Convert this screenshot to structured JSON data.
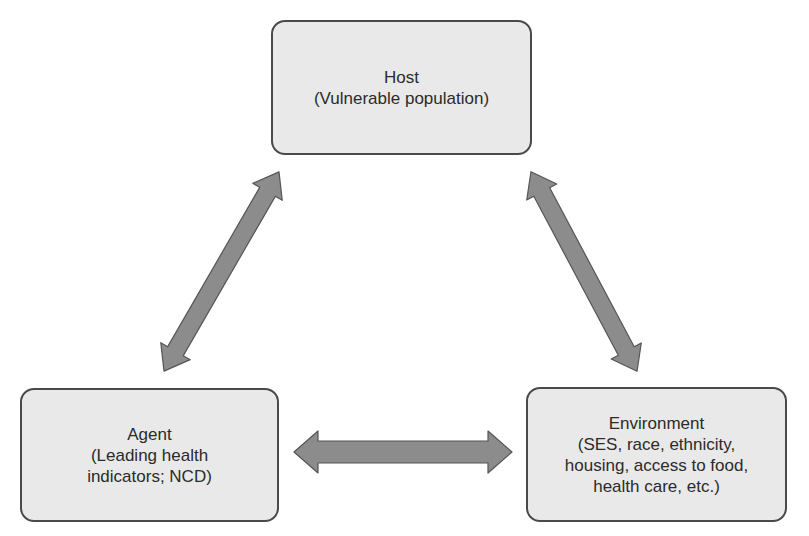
{
  "diagram": {
    "nodes": {
      "host": {
        "title": "Host",
        "lines": [
          "(Vulnerable population)"
        ]
      },
      "agent": {
        "title": "Agent",
        "lines": [
          "(Leading health",
          "indicators; NCD)"
        ]
      },
      "environment": {
        "title": "Environment",
        "lines": [
          "(SES, race, ethnicity,",
          "housing, access to food,",
          "health care, etc.)"
        ]
      }
    },
    "edges": [
      {
        "from": "host",
        "to": "agent",
        "type": "bidirectional"
      },
      {
        "from": "host",
        "to": "environment",
        "type": "bidirectional"
      },
      {
        "from": "agent",
        "to": "environment",
        "type": "bidirectional"
      }
    ],
    "colors": {
      "box_fill": "#e9e9e9",
      "box_border": "#4a4a4a",
      "arrow_fill": "#8c8c8c",
      "arrow_stroke": "#555555",
      "text": "#2b2b2b"
    }
  }
}
